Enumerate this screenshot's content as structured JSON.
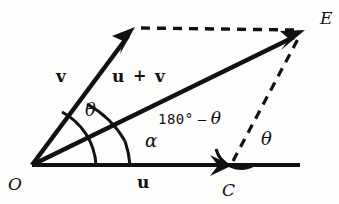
{
  "figure": {
    "type": "vector-addition-parallelogram-diagram",
    "background_color": "#fdfdfb",
    "ink_color": "#111111",
    "labels": {
      "origin": "O",
      "point_c": "C",
      "point_e": "E",
      "vector_v": "v",
      "vector_u": "u",
      "resultant_u": "u",
      "resultant_plus": "+",
      "resultant_v": "v",
      "angle_theta_origin": "θ",
      "angle_alpha": "α",
      "angle_theta_c": "θ",
      "supplement_prefix": "180°",
      "supplement_minus": "–",
      "supplement_theta": "θ"
    },
    "geometry": {
      "origin": [
        32,
        165
      ],
      "v_tip": [
        134,
        28
      ],
      "c_point": [
        232,
        165
      ],
      "e_point": [
        303,
        31
      ],
      "baseline_end": [
        300,
        165
      ],
      "dashed_top": [
        [
          140,
          28
        ],
        [
          298,
          30
        ]
      ],
      "dashed_diagonal": [
        [
          232,
          163
        ],
        [
          300,
          36
        ]
      ]
    }
  }
}
